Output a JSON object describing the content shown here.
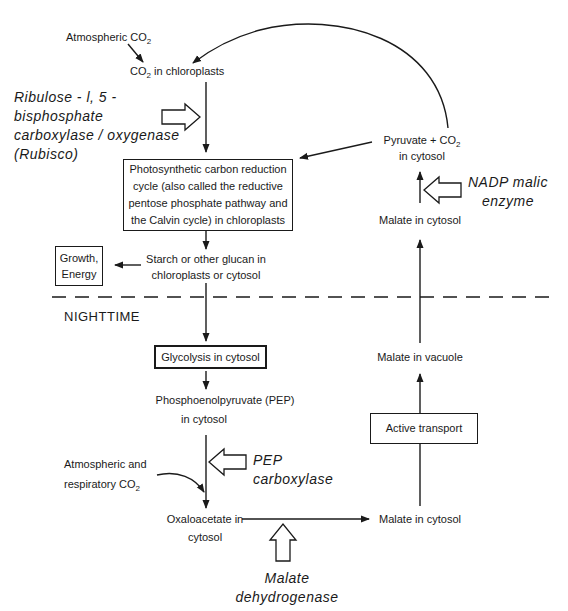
{
  "diagram": {
    "nodes": {
      "atm_co2": {
        "text": "Atmospheric CO",
        "sub": "2"
      },
      "co2_chloro": {
        "pre": "CO",
        "sub": "2",
        "post": " in chloroplasts"
      },
      "calvin": [
        "Photosynthetic carbon reduction",
        "cycle (also called the reductive",
        "pentose phosphate pathway and",
        "the Calvin cycle) in chloroplasts"
      ],
      "starch": [
        "Starch or other glucan in",
        "chloroplasts or cytosol"
      ],
      "growth": [
        "Growth,",
        "Energy"
      ],
      "pyruvate": {
        "line1": "Pyruvate + CO",
        "sub": "2",
        "line2": "in cytosol"
      },
      "malate_cytosol_top": "Malate in cytosol",
      "nighttime": "NIGHTTIME",
      "glycolysis": "Glycolysis in cytosol",
      "pep": [
        "Phosphoenolpyruvate (PEP)",
        "in cytosol"
      ],
      "atm_resp": {
        "line1": "Atmospheric and",
        "line2": "respiratory CO",
        "sub": "2"
      },
      "oxaloacetate": [
        "Oxaloacetate in",
        "cytosol"
      ],
      "malate_cytosol_bottom": "Malate in cytosol",
      "active_transport": "Active transport",
      "malate_vacuole": "Malate in vacuole"
    },
    "enzymes": {
      "rubisco": [
        "Ribulose - l, 5 -",
        "bisphosphate",
        "carboxylase / oxygenase",
        "(Rubisco)"
      ],
      "nadp": [
        "NADP malic",
        "enzyme"
      ],
      "pepc": [
        "PEP",
        "carboxylase"
      ],
      "mdh": [
        "Malate",
        "dehydrogenase"
      ]
    },
    "colors": {
      "ink": "#1a1a1a",
      "background": "#ffffff"
    }
  }
}
